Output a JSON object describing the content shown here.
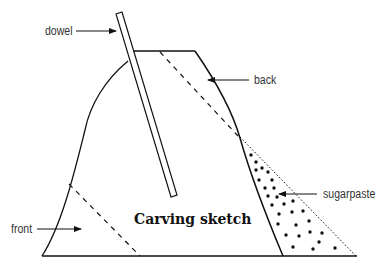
{
  "diagram": {
    "title": "Carving sketch",
    "labels": {
      "dowel": "dowel",
      "back": "back",
      "front": "front",
      "sugarpaste": "sugarpaste"
    },
    "colors": {
      "stroke": "#111111",
      "label": "#333333",
      "background": "#ffffff"
    }
  }
}
